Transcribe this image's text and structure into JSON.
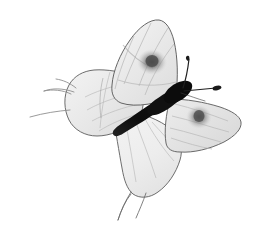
{
  "image": {
    "subject": "butterfly",
    "view": "dorsal-spread-wings",
    "orientation_note": "body axis runs diagonally from lower-left to upper-right",
    "background_color": "#ffffff",
    "width": 266,
    "height": 234
  },
  "palette": {
    "background": "#ffffff",
    "wing_fill_light": "#f2f2f2",
    "wing_fill_mid": "#e6e6e6",
    "wing_fill_shadow": "#d8d8d8",
    "wing_outline": "#5a5a5a",
    "wing_vein": "#b0b0b0",
    "eyespot_dark": "#6e6e6e",
    "eyespot_core": "#4a4a4a",
    "body_dark": "#141414",
    "antenna_dark": "#1f1f1f",
    "leg_gray": "#8c8c8c"
  },
  "anatomy": {
    "parts": [
      {
        "name": "forewing-upper-right",
        "label": "Upper right forewing",
        "fill": "#ededed",
        "has_eyespot": true,
        "eyespot_center": [
          152,
          62
        ],
        "eyespot_radius": 13
      },
      {
        "name": "forewing-upper-left",
        "label": "Upper left forewing",
        "fill": "#ebebeb",
        "has_eyespot": false
      },
      {
        "name": "hindwing-lower-right",
        "label": "Lower right hindwing",
        "fill": "#e9e9e9",
        "has_eyespot": true,
        "eyespot_center": [
          199,
          117
        ],
        "eyespot_radius": 11
      },
      {
        "name": "hindwing-lower-left",
        "label": "Lower left hindwing",
        "fill": "#efefef",
        "has_eyespot": false,
        "has_tails": true,
        "tail_count": 2
      },
      {
        "name": "body",
        "label": "Thorax and abdomen",
        "fill": "#141414",
        "orientation": "diagonal",
        "from": [
          118,
          133
        ],
        "to": [
          182,
          88
        ]
      },
      {
        "name": "antenna-upper",
        "label": "Upper antenna",
        "tip": [
          189,
          57
        ],
        "clubbed": true
      },
      {
        "name": "antenna-lower",
        "label": "Lower antenna",
        "tip": [
          219,
          88
        ],
        "clubbed": true
      },
      {
        "name": "legs-left",
        "label": "Left legs",
        "count": 2,
        "extends_to_x": 28
      }
    ]
  },
  "bounds": {
    "butterfly_left": 28,
    "butterfly_right": 242,
    "butterfly_top": 19,
    "butterfly_bottom": 222
  },
  "accessibility": {
    "alt_text": "Grayscale photograph of a pale butterfly with wings spread, dark slender body running diagonally, two clubbed antennae, and dark eyespots on the upper right forewing and lower right hindwing."
  }
}
